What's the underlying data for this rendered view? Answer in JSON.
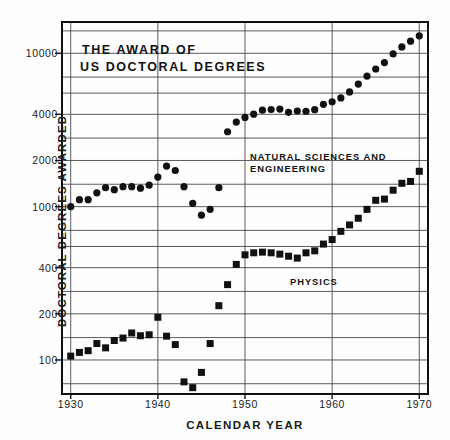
{
  "chart_data": {
    "type": "scatter",
    "title": "THE AWARD OF US DOCTORAL DEGREES",
    "title_line1": "THE AWARD OF",
    "title_line2": "US DOCTORAL DEGREES",
    "xlabel": "CALENDAR YEAR",
    "ylabel": "DOCTORAL DEGREES AWARDED",
    "yscale": "log",
    "xlim": [
      1929,
      1971
    ],
    "ylim": [
      60,
      16000
    ],
    "grid": true,
    "legend_position": "inline-annotation",
    "x_ticks": [
      1930,
      1940,
      1950,
      1960,
      1970
    ],
    "x_tick_labels": [
      "1930",
      "1940",
      "1950",
      "1960",
      "1970"
    ],
    "y_ticks": [
      100,
      200,
      400,
      1000,
      2000,
      4000,
      10000
    ],
    "y_tick_labels": [
      "100",
      "200",
      "400",
      "1000",
      "2000",
      "4000",
      "10000"
    ],
    "gridlines_y": [
      70,
      100,
      140,
      200,
      280,
      400,
      550,
      700,
      1000,
      1400,
      2000,
      2800,
      4000,
      5500,
      7000,
      10000,
      14000
    ],
    "series": [
      {
        "name": "NATURAL SCIENCES AND ENGINEERING",
        "annotation": "NATURAL SCIENCES AND\nENGINEERING",
        "annotation_line1": "NATURAL SCIENCES AND",
        "annotation_line2": "ENGINEERING",
        "marker": "circle",
        "color": "#111111",
        "x": [
          1930,
          1931,
          1932,
          1933,
          1934,
          1935,
          1936,
          1937,
          1938,
          1939,
          1940,
          1941,
          1942,
          1943,
          1944,
          1945,
          1946,
          1947,
          1948,
          1949,
          1950,
          1951,
          1952,
          1953,
          1954,
          1955,
          1956,
          1957,
          1958,
          1959,
          1960,
          1961,
          1962,
          1963,
          1964,
          1965,
          1966,
          1967,
          1968,
          1969,
          1970
        ],
        "values": [
          1000,
          1110,
          1110,
          1230,
          1330,
          1290,
          1350,
          1350,
          1320,
          1380,
          1560,
          1840,
          1720,
          1350,
          1050,
          880,
          960,
          1330,
          3080,
          3560,
          3820,
          4010,
          4260,
          4300,
          4330,
          4120,
          4200,
          4190,
          4290,
          4650,
          4830,
          5120,
          5600,
          6300,
          7100,
          7900,
          8700,
          9900,
          11000,
          12000,
          13000
        ]
      },
      {
        "name": "PHYSICS",
        "annotation": "PHYSICS",
        "marker": "square",
        "color": "#111111",
        "x": [
          1930,
          1931,
          1932,
          1933,
          1934,
          1935,
          1936,
          1937,
          1938,
          1939,
          1940,
          1941,
          1942,
          1943,
          1944,
          1945,
          1946,
          1947,
          1948,
          1949,
          1950,
          1951,
          1952,
          1953,
          1954,
          1955,
          1956,
          1957,
          1958,
          1959,
          1960,
          1961,
          1962,
          1963,
          1964,
          1965,
          1966,
          1967,
          1968,
          1969,
          1970
        ],
        "values": [
          106,
          112,
          115,
          128,
          120,
          134,
          139,
          150,
          144,
          146,
          190,
          143,
          126,
          72,
          66,
          83,
          128,
          226,
          310,
          420,
          485,
          500,
          505,
          500,
          490,
          475,
          462,
          500,
          515,
          570,
          610,
          690,
          760,
          840,
          960,
          1100,
          1120,
          1280,
          1420,
          1460,
          1700
        ]
      }
    ]
  },
  "axes": {
    "y_title": "DOCTORAL DEGREES AWARDED",
    "x_title": "CALENDAR YEAR"
  }
}
